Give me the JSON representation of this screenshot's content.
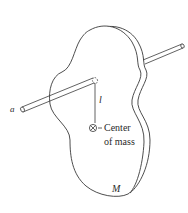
{
  "diagram": {
    "labels": {
      "axis": "a",
      "length": "l",
      "center_line1": "Center",
      "center_line2": "of mass",
      "mass": "M"
    },
    "colors": {
      "stroke": "#3a3a3a",
      "background": "#ffffff"
    }
  }
}
